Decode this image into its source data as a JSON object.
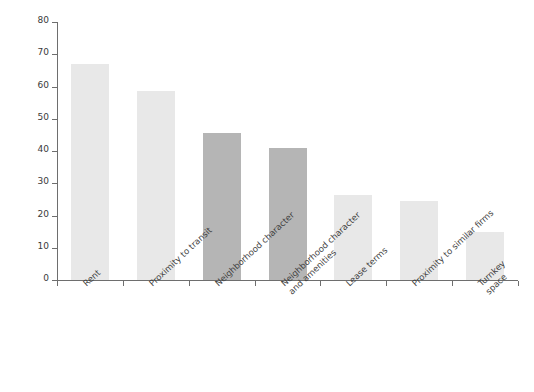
{
  "chart_data": {
    "type": "bar",
    "title": "",
    "xlabel": "",
    "ylabel": "Percentage of firms ranking a factor in the top three",
    "ylim": [
      0,
      80
    ],
    "yticks": [
      0,
      10,
      20,
      30,
      40,
      50,
      60,
      70,
      80
    ],
    "grid": false,
    "legend": "none",
    "categories": [
      "Rent",
      "Proximity to transit",
      "Neighborhood character",
      "Neighborhood character\nand amenities",
      "Lease terms",
      "Proximity to similar firms",
      "Turnkey space"
    ],
    "values": [
      67,
      58.5,
      45.5,
      41,
      26.5,
      24.5,
      15
    ],
    "bar_colors": [
      "#e8e8e8",
      "#e8e8e8",
      "#b5b5b5",
      "#b5b5b5",
      "#e8e8e8",
      "#e8e8e8",
      "#e8e8e8"
    ],
    "axis_color": "#6e6e6e"
  }
}
